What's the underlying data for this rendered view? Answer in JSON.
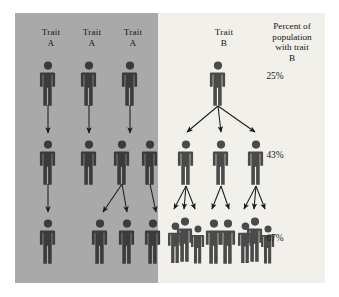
{
  "figure": {
    "title_alt": "Trait A versus Trait B transmission diagram",
    "colors": {
      "panel_a_bg": "#a9a9a9",
      "panel_b_bg": "#f1f0ea",
      "person": "#4a4a4a",
      "person_dark": "#3b3b3b",
      "arrow": "#1c1c1c",
      "text": "#15161a",
      "page_bg": "#ffffff"
    }
  },
  "panel_a": {
    "name": "Trait A panel",
    "labels": [
      {
        "text": "Trait\nA",
        "x": 22,
        "y": 14
      },
      {
        "text": "Trait\nA",
        "x": 63,
        "y": 14
      },
      {
        "text": "Trait\nA",
        "x": 104,
        "y": 14
      }
    ],
    "generations": [
      {
        "level": 1,
        "people": [
          {
            "id": "a-g1-1",
            "x": 26,
            "y": 48,
            "scale": 1.0
          },
          {
            "id": "a-g1-2",
            "x": 67,
            "y": 48,
            "scale": 1.0
          },
          {
            "id": "a-g1-3",
            "x": 108,
            "y": 48,
            "scale": 1.0
          }
        ]
      },
      {
        "level": 2,
        "people": [
          {
            "id": "a-g2-1",
            "x": 26,
            "y": 127,
            "scale": 1.0
          },
          {
            "id": "a-g2-2",
            "x": 67,
            "y": 127,
            "scale": 1.0
          },
          {
            "id": "a-g2-3",
            "x": 100,
            "y": 127,
            "scale": 1.0
          },
          {
            "id": "a-g2-4",
            "x": 128,
            "y": 127,
            "scale": 1.0
          }
        ]
      },
      {
        "level": 3,
        "people": [
          {
            "id": "a-g3-1",
            "x": 26,
            "y": 206,
            "scale": 1.0
          },
          {
            "id": "a-g3-2",
            "x": 78,
            "y": 206,
            "scale": 1.0
          },
          {
            "id": "a-g3-3",
            "x": 105,
            "y": 206,
            "scale": 1.0
          },
          {
            "id": "a-g3-4",
            "x": 131,
            "y": 206,
            "scale": 1.0
          }
        ]
      }
    ],
    "arrows": [
      {
        "x1": 33,
        "y1": 92,
        "x2": 33,
        "y2": 120
      },
      {
        "x1": 74,
        "y1": 92,
        "x2": 74,
        "y2": 120
      },
      {
        "x1": 115,
        "y1": 92,
        "x2": 115,
        "y2": 120
      },
      {
        "x1": 33,
        "y1": 171,
        "x2": 33,
        "y2": 199
      },
      {
        "x1": 107,
        "y1": 171,
        "x2": 88,
        "y2": 199
      },
      {
        "x1": 107,
        "y1": 171,
        "x2": 112,
        "y2": 199
      },
      {
        "x1": 135,
        "y1": 171,
        "x2": 141,
        "y2": 199
      }
    ]
  },
  "panel_b": {
    "name": "Trait B panel",
    "label": {
      "text": "Trait\nB",
      "x": 195,
      "y": 14
    },
    "header": {
      "text": "Percent of\npopulation\nwith trait\nB",
      "x": 238,
      "y": 8
    },
    "percents": [
      {
        "value": "25%",
        "x": 240,
        "y": 58
      },
      {
        "value": "43%",
        "x": 240,
        "y": 137
      },
      {
        "value": "67%",
        "x": 240,
        "y": 220
      }
    ],
    "generations": [
      {
        "level": 1,
        "people": [
          {
            "id": "b-g1-1",
            "x": 196,
            "y": 48,
            "scale": 1.0
          }
        ]
      },
      {
        "level": 2,
        "people": [
          {
            "id": "b-g2-1",
            "x": 164,
            "y": 127,
            "scale": 1.0
          },
          {
            "id": "b-g2-2",
            "x": 199,
            "y": 127,
            "scale": 1.0
          },
          {
            "id": "b-g2-3",
            "x": 234,
            "y": 127,
            "scale": 1.0
          }
        ]
      },
      {
        "level": 3,
        "groups": [
          {
            "id": "b-g3-grp1",
            "count": 3,
            "people": [
              {
                "id": "b-g3-1a",
                "x": 154,
                "y": 209,
                "scale": 0.92
              },
              {
                "id": "b-g3-1b",
                "x": 163,
                "y": 204,
                "scale": 1.0
              },
              {
                "id": "b-g3-1c",
                "x": 177,
                "y": 212,
                "scale": 0.86
              }
            ]
          },
          {
            "id": "b-g3-grp2",
            "count": 2,
            "people": [
              {
                "id": "b-g3-2a",
                "x": 192,
                "y": 206,
                "scale": 1.0
              },
              {
                "id": "b-g3-2b",
                "x": 206,
                "y": 206,
                "scale": 1.0
              }
            ]
          },
          {
            "id": "b-g3-grp3",
            "count": 3,
            "people": [
              {
                "id": "b-g3-3a",
                "x": 224,
                "y": 209,
                "scale": 0.92
              },
              {
                "id": "b-g3-3b",
                "x": 233,
                "y": 204,
                "scale": 1.0
              },
              {
                "id": "b-g3-3c",
                "x": 247,
                "y": 212,
                "scale": 0.86
              }
            ]
          }
        ]
      }
    ],
    "arrows_gen1": [
      {
        "x1": 203,
        "y1": 93,
        "x2": 172,
        "y2": 119
      },
      {
        "x1": 203,
        "y1": 93,
        "x2": 206,
        "y2": 119
      },
      {
        "x1": 203,
        "y1": 93,
        "x2": 240,
        "y2": 119
      }
    ],
    "arrows_gen2": [
      {
        "x1": 171,
        "y1": 173,
        "x2": 159,
        "y2": 196
      },
      {
        "x1": 171,
        "y1": 173,
        "x2": 169,
        "y2": 196
      },
      {
        "x1": 171,
        "y1": 173,
        "x2": 180,
        "y2": 196
      },
      {
        "x1": 206,
        "y1": 173,
        "x2": 197,
        "y2": 196
      },
      {
        "x1": 206,
        "y1": 173,
        "x2": 214,
        "y2": 196
      },
      {
        "x1": 241,
        "y1": 173,
        "x2": 229,
        "y2": 196
      },
      {
        "x1": 241,
        "y1": 173,
        "x2": 239,
        "y2": 196
      },
      {
        "x1": 241,
        "y1": 173,
        "x2": 250,
        "y2": 196
      }
    ]
  }
}
